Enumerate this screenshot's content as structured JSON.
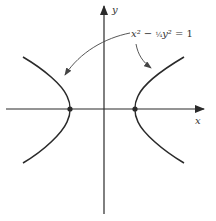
{
  "diagram": {
    "type": "hyperbola-plot",
    "equation": "x² − ¼y² = 1",
    "equation_parts": {
      "x2": "x²",
      "minus": " − ",
      "frac": "¼",
      "y2": "y²",
      "rhs": " = 1"
    },
    "axes": {
      "x_label": "x",
      "y_label": "y"
    },
    "vertices": [
      "(-1, 0)",
      "(1, 0)"
    ],
    "colors": {
      "stroke": "#2a2a2a",
      "text": "#333333",
      "background": "#ffffff"
    }
  }
}
